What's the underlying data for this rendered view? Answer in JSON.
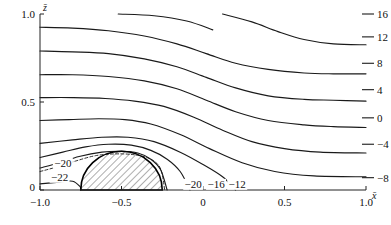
{
  "chart_data": {
    "type": "line",
    "title": "",
    "subtitle": "",
    "xlabel": "x̄",
    "ylabel": "z̄",
    "xlim": [
      -1.0,
      1.0
    ],
    "ylim": [
      0.0,
      1.0
    ],
    "grid": false,
    "legend": "none",
    "x_ticks": [
      {
        "value": -1.0,
        "label": "−1.0"
      },
      {
        "value": -0.5,
        "label": "−0.5"
      },
      {
        "value": 0.0,
        "label": "0"
      },
      {
        "value": 0.5,
        "label": "0.5"
      },
      {
        "value": 1.0,
        "label": "1.0"
      }
    ],
    "y_ticks": [
      {
        "value": 0.0,
        "label": "0"
      },
      {
        "value": 0.5,
        "label": "0.5"
      },
      {
        "value": 1.0,
        "label": "1.0"
      }
    ],
    "obstacle": {
      "shape": "semicircle",
      "hatched": true,
      "x_center": -0.5,
      "x_left": -0.75,
      "x_right": -0.25,
      "radius_x": 0.25,
      "height": 0.22
    },
    "contour_levels": [
      16,
      12,
      8,
      4,
      0,
      -4,
      -8,
      -12,
      -16,
      -20,
      -22
    ],
    "right_edge_labels": [
      {
        "level": 16,
        "text": "16",
        "y": 1.0
      },
      {
        "level": 12,
        "text": "12",
        "y": 0.87
      },
      {
        "level": 8,
        "text": "8",
        "y": 0.72
      },
      {
        "level": 4,
        "text": "4",
        "y": 0.57
      },
      {
        "level": 0,
        "text": "0",
        "y": 0.41
      },
      {
        "level": -4,
        "text": "−4",
        "y": 0.26
      },
      {
        "level": -8,
        "text": "−8",
        "y": 0.07
      }
    ],
    "inline_labels": [
      {
        "text": "−20",
        "x": -0.86,
        "y": 0.155
      },
      {
        "text": "−22",
        "x": -0.88,
        "y": 0.075
      },
      {
        "text": "−20",
        "x": -0.06,
        "y": 0.035
      },
      {
        "text": "−16",
        "x": 0.08,
        "y": 0.035
      },
      {
        "text": "−12",
        "x": 0.21,
        "y": 0.035
      }
    ],
    "series": [
      {
        "name": "16",
        "style": "solid",
        "points": [
          [
            -0.52,
            1.0
          ],
          [
            -0.3,
            0.99
          ],
          [
            -0.1,
            0.96
          ],
          [
            0.06,
            0.91
          ]
        ]
      },
      {
        "name": "16b",
        "style": "solid",
        "points": [
          [
            0.12,
            1.0
          ],
          [
            0.3,
            0.955
          ],
          [
            0.46,
            0.9
          ],
          [
            0.62,
            0.855
          ],
          [
            0.8,
            0.83
          ],
          [
            1.0,
            0.825
          ]
        ]
      },
      {
        "name": "12",
        "style": "solid",
        "points": [
          [
            -1.0,
            0.925
          ],
          [
            -0.8,
            0.92
          ],
          [
            -0.58,
            0.905
          ],
          [
            -0.36,
            0.875
          ],
          [
            -0.16,
            0.83
          ],
          [
            0.02,
            0.775
          ],
          [
            0.2,
            0.72
          ],
          [
            0.4,
            0.685
          ],
          [
            0.62,
            0.665
          ],
          [
            0.8,
            0.66
          ],
          [
            1.0,
            0.66
          ]
        ]
      },
      {
        "name": "8",
        "style": "solid",
        "points": [
          [
            -1.0,
            0.79
          ],
          [
            -0.8,
            0.785
          ],
          [
            -0.58,
            0.775
          ],
          [
            -0.36,
            0.745
          ],
          [
            -0.16,
            0.7
          ],
          [
            0.02,
            0.64
          ],
          [
            0.2,
            0.58
          ],
          [
            0.4,
            0.535
          ],
          [
            0.62,
            0.515
          ],
          [
            0.8,
            0.51
          ],
          [
            1.0,
            0.505
          ]
        ]
      },
      {
        "name": "4",
        "style": "solid",
        "points": [
          [
            -1.0,
            0.655
          ],
          [
            -0.8,
            0.655
          ],
          [
            -0.58,
            0.645
          ],
          [
            -0.36,
            0.62
          ],
          [
            -0.16,
            0.575
          ],
          [
            0.02,
            0.51
          ],
          [
            0.2,
            0.445
          ],
          [
            0.4,
            0.395
          ],
          [
            0.62,
            0.37
          ],
          [
            0.8,
            0.36
          ],
          [
            1.0,
            0.355
          ]
        ]
      },
      {
        "name": "0",
        "style": "solid",
        "points": [
          [
            -1.0,
            0.525
          ],
          [
            -0.8,
            0.525
          ],
          [
            -0.6,
            0.52
          ],
          [
            -0.42,
            0.505
          ],
          [
            -0.24,
            0.475
          ],
          [
            -0.06,
            0.415
          ],
          [
            0.12,
            0.34
          ],
          [
            0.3,
            0.275
          ],
          [
            0.5,
            0.235
          ],
          [
            0.72,
            0.215
          ],
          [
            1.0,
            0.21
          ]
        ]
      },
      {
        "name": "-4",
        "style": "solid",
        "points": [
          [
            -1.0,
            0.395
          ],
          [
            -0.82,
            0.4
          ],
          [
            -0.64,
            0.405
          ],
          [
            -0.48,
            0.4
          ],
          [
            -0.32,
            0.375
          ],
          [
            -0.14,
            0.315
          ],
          [
            0.04,
            0.235
          ],
          [
            0.24,
            0.155
          ],
          [
            0.44,
            0.105
          ],
          [
            0.68,
            0.08
          ],
          [
            1.0,
            0.075
          ]
        ]
      },
      {
        "name": "-8",
        "style": "solid",
        "points": [
          [
            -1.0,
            0.265
          ],
          [
            -0.8,
            0.285
          ],
          [
            -0.62,
            0.3
          ],
          [
            -0.46,
            0.3
          ],
          [
            -0.3,
            0.275
          ],
          [
            -0.14,
            0.215
          ],
          [
            0.0,
            0.145
          ],
          [
            0.12,
            0.075
          ],
          [
            0.2,
            0.0
          ]
        ]
      },
      {
        "name": "-12",
        "style": "solid",
        "points": [
          [
            -1.0,
            0.185
          ],
          [
            -0.86,
            0.215
          ],
          [
            -0.72,
            0.245
          ],
          [
            -0.58,
            0.26
          ],
          [
            -0.44,
            0.255
          ],
          [
            -0.32,
            0.225
          ],
          [
            -0.22,
            0.175
          ],
          [
            -0.14,
            0.105
          ],
          [
            -0.08,
            0.0
          ]
        ]
      },
      {
        "name": "-16",
        "style": "solid",
        "points": [
          [
            -1.0,
            0.125
          ],
          [
            -0.88,
            0.155
          ],
          [
            -0.76,
            0.19
          ],
          [
            -0.62,
            0.215
          ],
          [
            -0.5,
            0.22
          ],
          [
            -0.4,
            0.21
          ],
          [
            -0.32,
            0.175
          ],
          [
            -0.26,
            0.115
          ],
          [
            -0.22,
            0.0
          ]
        ]
      },
      {
        "name": "-20",
        "style": "dashed",
        "points": [
          [
            -1.0,
            0.105
          ],
          [
            -0.9,
            0.13
          ],
          [
            -0.78,
            0.165
          ],
          [
            -0.66,
            0.195
          ],
          [
            -0.54,
            0.205
          ],
          [
            -0.42,
            0.2
          ],
          [
            -0.32,
            0.175
          ],
          [
            -0.26,
            0.12
          ],
          [
            -0.235,
            0.0
          ]
        ]
      },
      {
        "name": "-22",
        "style": "solid",
        "points": [
          [
            -1.0,
            0.035
          ],
          [
            -0.88,
            0.045
          ],
          [
            -0.8,
            0.05
          ],
          [
            -0.755,
            0.02
          ],
          [
            -0.75,
            0.0
          ]
        ]
      }
    ]
  },
  "axis_labels": {
    "x_axis_name": "x̄",
    "y_axis_name": "z̄"
  }
}
